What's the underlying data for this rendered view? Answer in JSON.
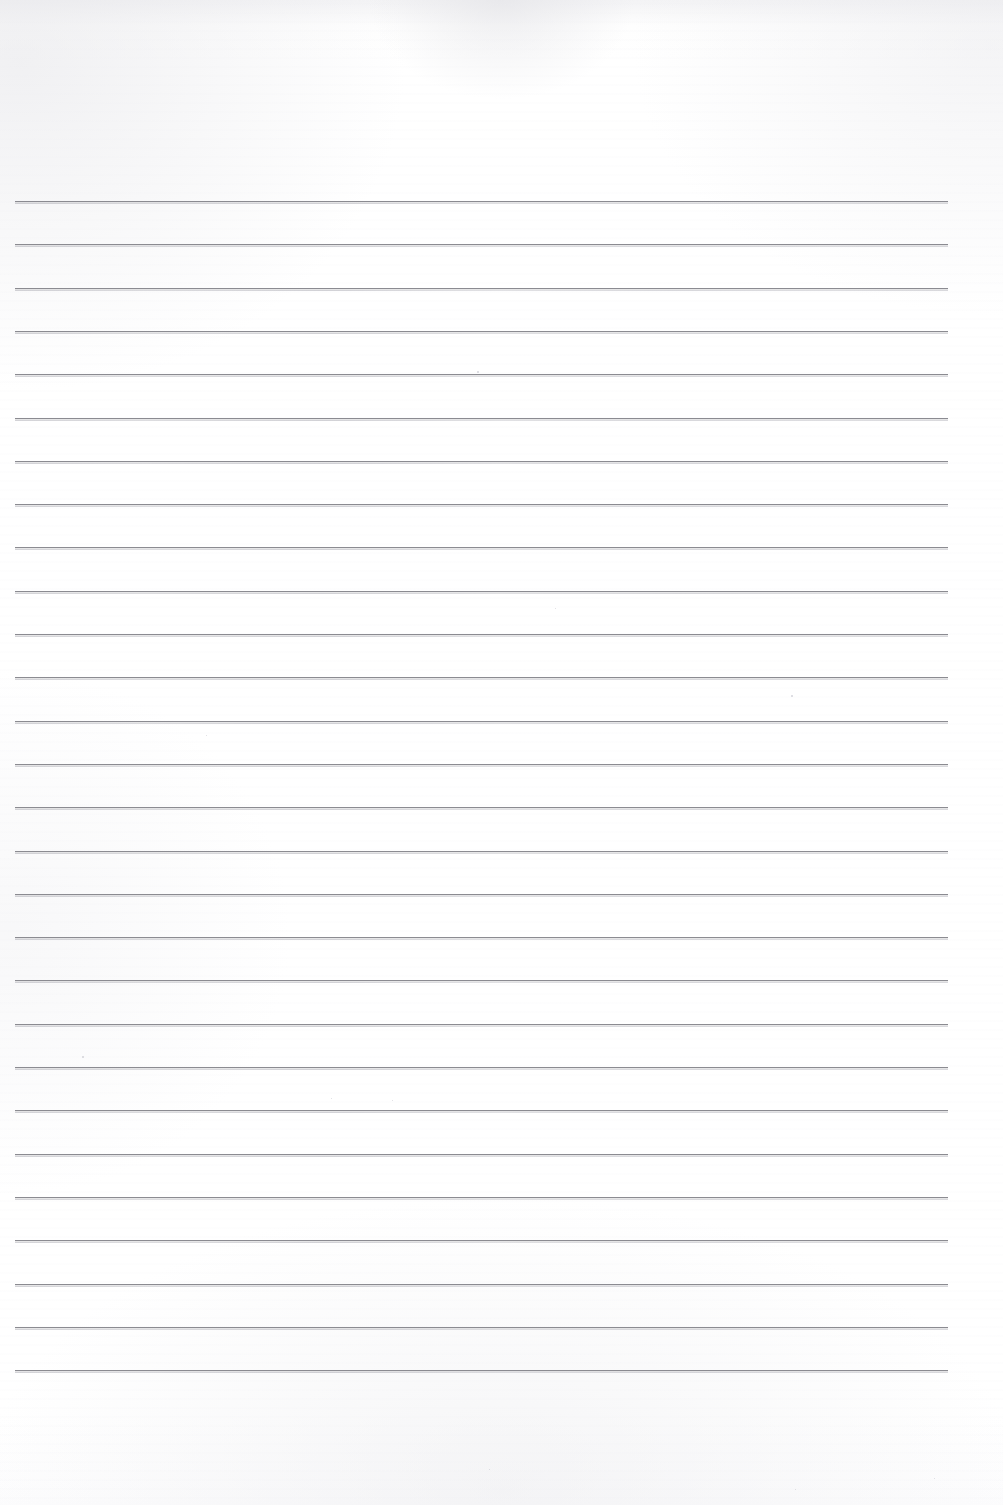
{
  "document": {
    "type": "scanned-blank-lined-paper",
    "title": "Blank Lined Notebook Page",
    "page_width": 1003,
    "page_height": 1505,
    "background_color": "#ffffff",
    "paper_tint": "#fefefe",
    "has_text": false,
    "has_handwriting": false,
    "has_margin_rule": false,
    "has_header": false,
    "has_footer": false,
    "page_number_shown": ""
  },
  "ruling": {
    "line_color": "#8b8b91",
    "line_thickness_px": 1,
    "line_count": 28,
    "first_line_y": 201,
    "line_spacing_px": 43.3,
    "left_x": 15,
    "right_x": 948,
    "line_length_px": 933,
    "orientation": "horizontal",
    "lines_y": [
      201,
      244.3,
      287.6,
      330.9,
      374.2,
      417.5,
      460.8,
      504.1,
      547.4,
      590.7,
      634.0,
      677.3,
      720.6,
      763.9,
      807.2,
      850.5,
      893.8,
      937.1,
      980.4,
      1023.7,
      1067.0,
      1110.3,
      1153.6,
      1196.9,
      1240.2,
      1283.5,
      1326.8,
      1370.1
    ]
  },
  "margins": {
    "top_blank_px": 201,
    "bottom_blank_px": 134,
    "left_px": 15,
    "right_px": 55
  },
  "specks": [
    {
      "x": 477,
      "y": 371,
      "size": 1.6
    },
    {
      "x": 791,
      "y": 695,
      "size": 1.6
    },
    {
      "x": 206,
      "y": 735,
      "size": 1.4
    },
    {
      "x": 555,
      "y": 608,
      "size": 1.3
    },
    {
      "x": 1231,
      "y": 688,
      "size": 1.2
    },
    {
      "x": 82,
      "y": 1056,
      "size": 1.5
    },
    {
      "x": 331,
      "y": 1098,
      "size": 1.4
    },
    {
      "x": 392,
      "y": 1100,
      "size": 1.2
    },
    {
      "x": 934,
      "y": 1478,
      "size": 1.3
    },
    {
      "x": 489,
      "y": 1469,
      "size": 1.2
    },
    {
      "x": 795,
      "y": 1489,
      "size": 1.4
    }
  ]
}
